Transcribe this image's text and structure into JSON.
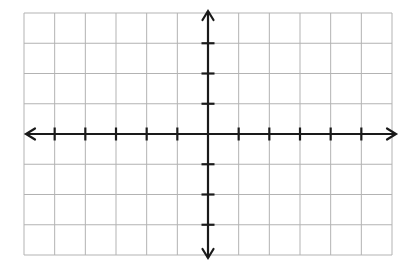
{
  "page": {
    "background_color": "#ffffff",
    "width": 416,
    "height": 267
  },
  "chart_data": {
    "type": "scatter",
    "title": "",
    "subtitle": "",
    "xlabel": "",
    "ylabel": "",
    "series": [],
    "data_points": [],
    "annotations": [],
    "legend": {
      "entries": [],
      "position": "none",
      "visible": false
    },
    "grid": {
      "visible": true,
      "color": "#b3b3b3",
      "line_width": 1,
      "columns": 12,
      "rows": 8,
      "left_px": 24,
      "top_px": 13,
      "right_px": 392,
      "bottom_px": 255,
      "cell_width_px": 30.67,
      "cell_height_px": 30.25
    },
    "axes": {
      "color": "#1a1a1a",
      "line_width": 2.2,
      "x_axis": {
        "name": "x-axis",
        "position_px": 134,
        "origin_cell_from_left": 6,
        "start_px": 26,
        "end_px": 396,
        "arrow_start": true,
        "arrow_end": true,
        "xlim": [
          -6,
          6
        ],
        "tick_count_negative": 5,
        "tick_count_positive": 5,
        "tick_interval": 1,
        "tick_length_px": 13,
        "tick_labels": [],
        "labels_visible": false
      },
      "y_axis": {
        "name": "y-axis",
        "position_px": 208,
        "origin_cell_from_top": 4,
        "start_px": 11,
        "end_px": 258,
        "arrow_start": true,
        "arrow_end": true,
        "ylim": [
          -4,
          4
        ],
        "tick_count_positive": 3,
        "tick_count_negative": 3,
        "tick_interval": 1,
        "tick_length_px": 13,
        "tick_labels": [],
        "labels_visible": false
      }
    },
    "origin": {
      "x_px": 208,
      "y_px": 134,
      "label": "",
      "label_visible": false
    }
  }
}
